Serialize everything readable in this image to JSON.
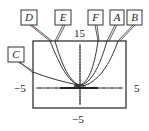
{
  "figure": {
    "window": {
      "xmin": "-5",
      "xmax": "5",
      "ymin": "-5",
      "ymax": "15"
    },
    "axis_labels": {
      "ymax_label": "15",
      "xmin_label": "−5",
      "xmax_label": "5",
      "ymin_label": "−5"
    },
    "curve_labels": [
      {
        "id": "D",
        "label": "D"
      },
      {
        "id": "E",
        "label": "E"
      },
      {
        "id": "F",
        "label": "F"
      },
      {
        "id": "A",
        "label": "A"
      },
      {
        "id": "B",
        "label": "B"
      },
      {
        "id": "C",
        "label": "C"
      }
    ],
    "colors": {
      "line": "#333333",
      "background": "#ffffff"
    }
  }
}
